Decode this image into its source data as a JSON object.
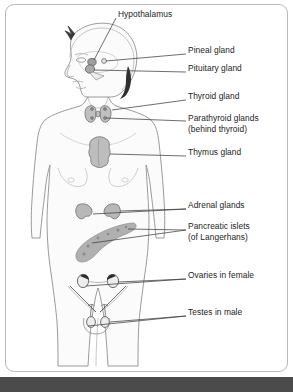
{
  "diagram": {
    "panel": {
      "border_color": "#b9b9b9",
      "background_color": "#ffffff",
      "corner_radius": "9px"
    },
    "style": {
      "text_color": "#1d1d1d",
      "leader_line_color": "#3d3d3d",
      "body_outline_color": "#8f8f8f",
      "body_fill_color": "#fbfbfb",
      "gland_fill_color": "#b4b4b4",
      "gland_outline_color": "#6e6e6e",
      "bottom_band_color": "#4b4b4b"
    },
    "labels": [
      {
        "id": "hypothalamus",
        "text": "Hypothalamus",
        "x": 118,
        "y": 14
      },
      {
        "id": "pineal-gland",
        "text": "Pineal gland",
        "x": 188,
        "y": 50
      },
      {
        "id": "pituitary-gland",
        "text": "Pituitary gland",
        "x": 188,
        "y": 68
      },
      {
        "id": "thyroid-gland",
        "text": "Thyroid gland",
        "x": 188,
        "y": 96
      },
      {
        "id": "parathyroid-glands",
        "text": "Parathyroid glands",
        "x": 188,
        "y": 118
      },
      {
        "id": "parathyroid-glands-sub",
        "text": "(behind thyroid)",
        "x": 188,
        "y": 129
      },
      {
        "id": "thymus-gland",
        "text": "Thymus gland",
        "x": 188,
        "y": 152
      },
      {
        "id": "adrenal-glands",
        "text": "Adrenal glands",
        "x": 188,
        "y": 205
      },
      {
        "id": "pancreatic-islets",
        "text": "Pancreatic islets",
        "x": 188,
        "y": 226
      },
      {
        "id": "pancreatic-islets-sub",
        "text": "(of Langerhans)",
        "x": 188,
        "y": 237
      },
      {
        "id": "ovaries-in-female",
        "text": "Ovaries in female",
        "x": 188,
        "y": 275
      },
      {
        "id": "testes-in-male",
        "text": "Testes in male",
        "x": 188,
        "y": 312
      }
    ]
  }
}
